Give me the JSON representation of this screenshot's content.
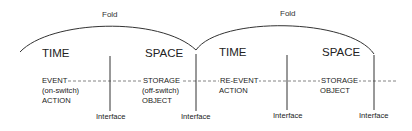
{
  "diagram": {
    "folds": [
      {
        "label": "Fold"
      },
      {
        "label": "Fold"
      }
    ],
    "sections": [
      {
        "heading": "TIME",
        "lines": [
          "EVENT",
          "(on-switch)",
          "ACTION"
        ]
      },
      {
        "heading": "SPACE",
        "lines": [
          "STORAGE",
          "(off-switch)",
          "OBJECT"
        ]
      },
      {
        "heading": "TIME",
        "lines": [
          "RE-EVENT",
          "ACTION"
        ]
      },
      {
        "heading": "SPACE",
        "lines": [
          "STORAGE",
          "OBJECT"
        ]
      }
    ],
    "interfaces": [
      {
        "label": "Interface"
      },
      {
        "label": "Interface"
      },
      {
        "label": "Interface"
      },
      {
        "label": "Interface"
      }
    ],
    "colors": {
      "line": "#333333",
      "dash": "#666666",
      "text": "#222222"
    }
  }
}
